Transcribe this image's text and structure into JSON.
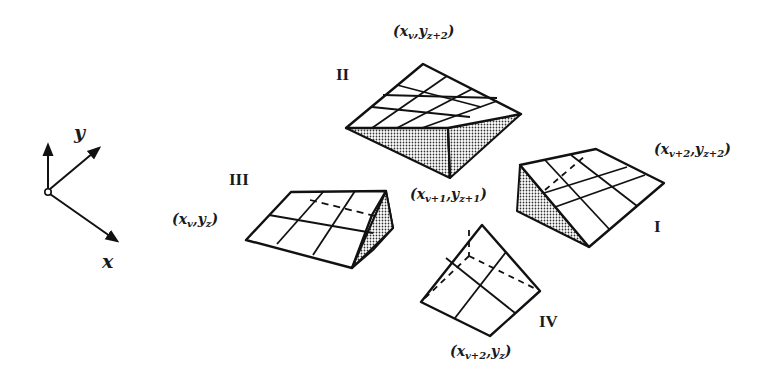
{
  "figure": {
    "type": "diagram",
    "axes": {
      "x_label": "x",
      "y_label": "y"
    },
    "patches": [
      {
        "id": "I",
        "label": "I",
        "corner_label": "(x_{v+2}, y_{z+2})"
      },
      {
        "id": "II",
        "label": "II",
        "corner_label": "(x_v, y_{z+2})"
      },
      {
        "id": "III",
        "label": "III",
        "corner_label": "(x_v, y_z)"
      },
      {
        "id": "IV",
        "label": "IV",
        "corner_label": "(x_{v+2}, y_z)"
      }
    ],
    "center_label": "(x_{v+1}, y_{z+1})",
    "labels": {
      "top": {
        "base": "x",
        "sub1": "v",
        "sep": ",",
        "base2": "y",
        "sub2": "z+2"
      },
      "center": {
        "base": "x",
        "sub1": "v+1",
        "sep": ",",
        "base2": "y",
        "sub2": "z+1"
      },
      "right": {
        "base": "x",
        "sub1": "v+2",
        "sep": ",",
        "base2": "y",
        "sub2": "z+2"
      },
      "left": {
        "base": "x",
        "sub1": "v",
        "sep": ",",
        "base2": "y",
        "sub2": "z"
      },
      "bottom": {
        "base": "x",
        "sub1": "v+2",
        "sep": ",",
        "base2": "y",
        "sub2": "z"
      }
    },
    "colors": {
      "stroke": "#111111",
      "stipple": "#3a3a3a",
      "background": "#ffffff"
    }
  }
}
